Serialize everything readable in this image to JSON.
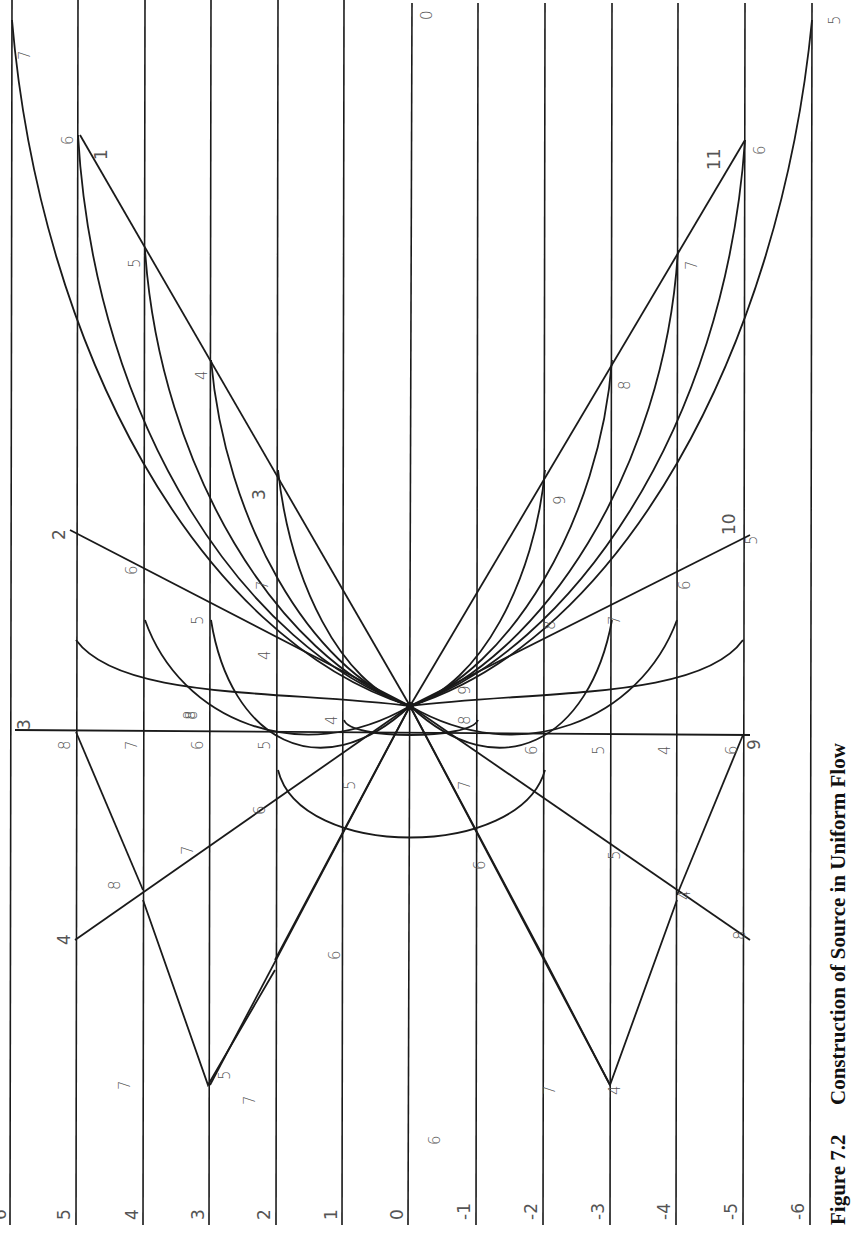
{
  "figure": {
    "number": "Figure 7.2",
    "title": "Construction of Source in Uniform Flow"
  },
  "orientation": "rotated 90° counter-clockwise (text reads bottom-to-top)",
  "streamline_grid": {
    "labels": [
      "6",
      "5",
      "4",
      "3",
      "2",
      "1",
      "0",
      "-1",
      "-2",
      "-3",
      "-4",
      "-5",
      "-6"
    ]
  },
  "source_point": {
    "label": "source"
  },
  "radial_line_labels": {
    "upper_left": [
      "1",
      "2",
      "3",
      "4"
    ],
    "upper_right": [
      "11",
      "10",
      "9",
      "8"
    ],
    "axis_top": "3",
    "axis_bottom": "9"
  },
  "intersection_labels": [
    "7",
    "6",
    "5",
    "4",
    "3",
    "6",
    "7",
    "6",
    "5",
    "4",
    "8",
    "7",
    "6",
    "5",
    "4",
    "8",
    "7",
    "6",
    "5",
    "7",
    "8",
    "9",
    "7",
    "6",
    "5",
    "4",
    "6",
    "7",
    "8",
    "9",
    "10",
    "5",
    "8",
    "7",
    "6",
    "11",
    "6",
    "5",
    "0",
    "5",
    "8",
    "5",
    "7",
    "6",
    "6",
    "5",
    "4",
    "7",
    "4",
    "8",
    "6"
  ],
  "colors": {
    "ink": "#1a1a1a",
    "label": "#555555",
    "background": "#ffffff"
  }
}
